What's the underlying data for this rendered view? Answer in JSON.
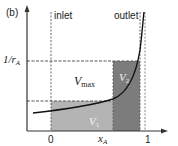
{
  "panel_label": "(b)",
  "labels": {
    "inlet": "inlet",
    "outlet": "outlet",
    "y_axis_main": "1/r",
    "y_axis_sub": "A",
    "x_axis_main": "x",
    "x_axis_sub": "A",
    "x_tick_0": "0",
    "x_tick_1": "1",
    "region_max_main": "V",
    "region_max_sub": "max",
    "region_1_main": "V",
    "region_1_sub": "1",
    "region_2_main": "V",
    "region_2_sub": "2"
  },
  "colors": {
    "axis": "#333333",
    "dashed": "#555555",
    "curve": "#111111",
    "region_1_fill": "#b4b4b4",
    "region_2_fill": "#7c7c7c"
  }
}
